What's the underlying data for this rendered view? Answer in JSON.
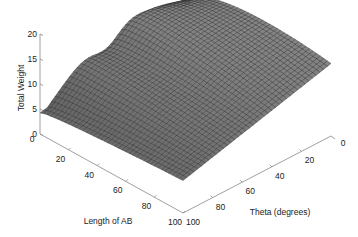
{
  "chart_data": {
    "type": "surface3d",
    "title": "",
    "xlabel": "Length of AB",
    "ylabel": "Theta (degrees)",
    "zlabel": "Total Weight",
    "x_ticks": [
      0,
      20,
      40,
      60,
      80,
      100
    ],
    "y_ticks": [
      0,
      20,
      40,
      60,
      80,
      100
    ],
    "z_ticks": [
      0,
      5,
      10,
      15,
      20
    ],
    "xlim": [
      0,
      100
    ],
    "ylim": [
      0,
      100
    ],
    "zlim": [
      0,
      20
    ],
    "colormap": "gray",
    "grid_resolution": 40,
    "corner_values": {
      "x0_y0": 18.5,
      "x100_y0": 12.0,
      "x0_y100": 5.5,
      "x100_y100": 6.5
    },
    "features": {
      "ridge_along_x0": "hump peaking near theta ~ 25 deg at about 14 along the Length=0 edge, dipping to ~9 near theta ~ 55",
      "saddle": "valley region near Length ~ 20-40, Theta ~ 50-70"
    }
  },
  "labels": {
    "zlabel": "Total Weight",
    "xlabel": "Length of AB",
    "ylabel": "Theta (degrees)",
    "z_ticks": [
      "0",
      "5",
      "10",
      "15",
      "20"
    ],
    "x_ticks": [
      "0",
      "20",
      "40",
      "60",
      "80",
      "100"
    ],
    "y_ticks": [
      "0",
      "20",
      "40",
      "60",
      "80",
      "100"
    ]
  }
}
